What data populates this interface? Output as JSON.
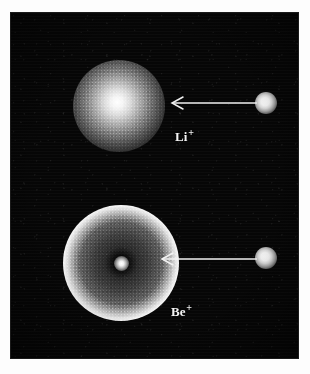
{
  "figure": {
    "panel_background_color": "#060606",
    "page_background_color": "#fdfdfd",
    "feature_color": "#ffffff",
    "annotation_color": "#f2f2f2"
  },
  "labels": {
    "lithium": {
      "species": "Li",
      "charge": "+",
      "full": "Li+"
    },
    "beryllium": {
      "species": "Be",
      "charge": "+",
      "full": "Be+"
    }
  },
  "features": [
    {
      "name": "lithium-ion-cloud",
      "kind": "filled-gaussian-sphere",
      "label": "Li+",
      "center_px": [
        108,
        93
      ],
      "radius_px": 46,
      "description": "diffuse bright spherical fluorescence cloud, brightest at centre"
    },
    {
      "name": "beryllium-ion-shell",
      "kind": "bright-annulus-with-core",
      "label": "Be+",
      "center_px": [
        110,
        250
      ],
      "outer_radius_px": 58,
      "ring_radius_px": 42,
      "core_radius_px": 7,
      "description": "bright ring shell surrounding a dimmer disk with a single bright ion at the centre"
    },
    {
      "name": "lithium-reference-spot",
      "kind": "point-source",
      "center_px": [
        255,
        90
      ],
      "radius_px": 11
    },
    {
      "name": "beryllium-reference-spot",
      "kind": "point-source",
      "center_px": [
        255,
        245
      ],
      "radius_px": 11
    }
  ],
  "arrows": [
    {
      "name": "arrow-to-lithium-cloud",
      "from_px": [
        244,
        90
      ],
      "to_px": [
        158,
        90
      ],
      "direction": "left"
    },
    {
      "name": "arrow-to-beryllium-core",
      "from_px": [
        244,
        246
      ],
      "to_px": [
        148,
        246
      ],
      "direction": "left"
    }
  ]
}
